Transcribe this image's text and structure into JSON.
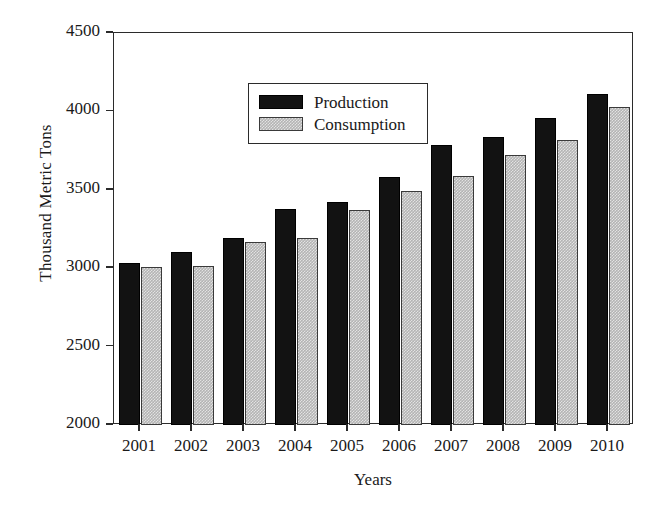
{
  "chart_data": {
    "type": "bar",
    "title": "",
    "xlabel": "Years",
    "ylabel": "Thousand Metric Tons",
    "categories": [
      "2001",
      "2002",
      "2003",
      "2004",
      "2005",
      "2006",
      "2007",
      "2008",
      "2009",
      "2010"
    ],
    "series": [
      {
        "name": "Production",
        "color": "#121212",
        "values": [
          3030,
          3105,
          3195,
          3375,
          3420,
          3580,
          3785,
          3835,
          3955,
          4110
        ]
      },
      {
        "name": "Consumption",
        "color": "#b4b4b4",
        "values": [
          3010,
          3015,
          3170,
          3195,
          3370,
          3490,
          3590,
          3720,
          3820,
          4030
        ]
      }
    ],
    "ylim": [
      2000,
      4500
    ],
    "yticks": [
      2000,
      2500,
      3000,
      3500,
      4000,
      4500
    ],
    "ytick_labels": [
      "2000",
      "2500",
      "3000",
      "3500",
      "4000",
      "4500"
    ],
    "grid": false,
    "legend_position": "upper left"
  },
  "axes": {
    "y_title": "Thousand Metric Tons",
    "x_title": "Years"
  },
  "legend": {
    "entries": [
      {
        "label": "Production",
        "swatch": "solid-black-swatch"
      },
      {
        "label": "Consumption",
        "swatch": "hatched-gray-swatch"
      }
    ]
  }
}
